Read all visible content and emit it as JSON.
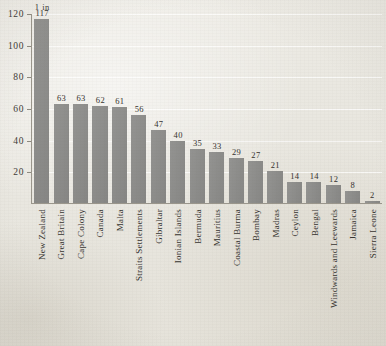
{
  "chart_data": {
    "type": "bar",
    "title": "",
    "subtitle": "",
    "xlabel": "",
    "ylabel": "",
    "annotation": "1 in",
    "ylim": [
      0,
      120
    ],
    "grid": true,
    "legend": "none",
    "orientation": "vertical",
    "bar_color": "#8d8d8b",
    "background_color": "#eceae4",
    "axis_color": "#9a968c",
    "yticks": [
      20,
      40,
      60,
      80,
      100,
      120
    ],
    "ytick_labels": [
      "20",
      "40",
      "60",
      "80",
      "100",
      "120"
    ],
    "categories": [
      "New Zealand",
      "Great Britain",
      "Cape Colony",
      "Canada",
      "Malta",
      "Straits Settlements",
      "Gibraltar",
      "Ionian Islands",
      "Bermuda",
      "Mauritius",
      "Coastal Burma",
      "Bombay",
      "Madras",
      "Ceylon",
      "Bengal",
      "Windwards and Leewards",
      "Jamaica",
      "Sierra Leone"
    ],
    "values": [
      117,
      63,
      63,
      62,
      61,
      56,
      47,
      40,
      35,
      33,
      29,
      27,
      21,
      14,
      14,
      12,
      8,
      2
    ],
    "value_labels": [
      "117",
      "63",
      "63",
      "62",
      "61",
      "56",
      "47",
      "40",
      "35",
      "33",
      "29",
      "27",
      "21",
      "14",
      "14",
      "12",
      "8",
      "2"
    ]
  }
}
